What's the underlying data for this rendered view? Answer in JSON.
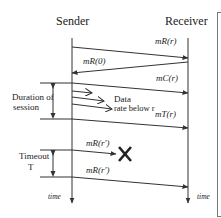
{
  "diagram": {
    "participants": {
      "sender": "Sender",
      "receiver": "Receiver"
    },
    "messages": [
      {
        "id": "m1",
        "label": "mR(r)",
        "direction": "sender-to-receiver"
      },
      {
        "id": "m2",
        "label": "mR(0)",
        "direction": "receiver-to-sender"
      },
      {
        "id": "m3",
        "label": "mC(r)",
        "direction": "sender-to-receiver"
      },
      {
        "id": "m4",
        "label": "mT(r)",
        "direction": "sender-to-receiver"
      },
      {
        "id": "m5",
        "label": "mR(r′)",
        "direction": "sender-to-receiver",
        "lost": true
      },
      {
        "id": "m6",
        "label": "mR(r′)",
        "direction": "sender-to-receiver"
      }
    ],
    "annotations": {
      "data_line1": "Data",
      "data_line2": "rate below r",
      "duration_line1": "Duration of",
      "duration_line2": "session",
      "timeout_line1": "Timeout",
      "timeout_line2": "T",
      "time_sender": "time",
      "time_receiver": "time"
    },
    "icons": {
      "lost_message": "✕"
    },
    "colors": {
      "line": "#333333",
      "text": "#222222",
      "background": "#ffffff"
    }
  }
}
